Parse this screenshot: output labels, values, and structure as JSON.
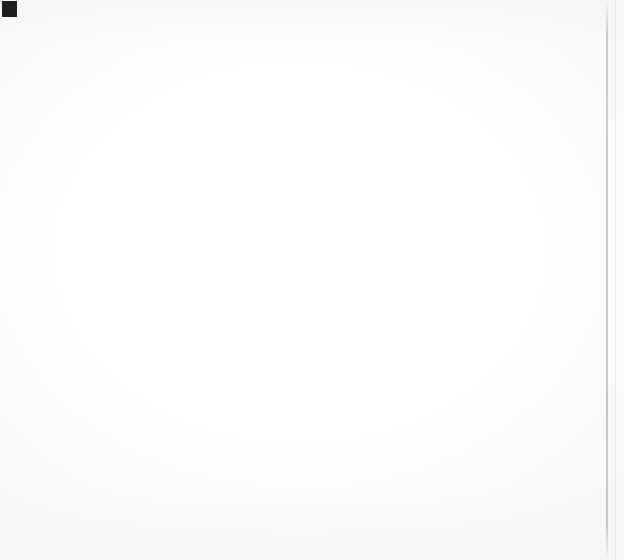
{
  "corner_mark": "black-square-register-mark",
  "chart_data": {
    "type": "bar",
    "orientation": "horizontal",
    "title": "Highest Marginal Tax Rate (2013)",
    "xlabel": "",
    "ylabel": "",
    "xlim": [
      0,
      70
    ],
    "grid": false,
    "legend": false,
    "categories": [
      "Denmark",
      "Japan",
      "Cuba",
      "Australia",
      "Germany",
      "China",
      "United States",
      "Canada",
      "Singapore",
      "Hong Kong",
      "Bolivia",
      "Russia",
      "Monaco"
    ],
    "values": [
      61,
      50,
      50,
      45,
      45,
      45,
      39.6,
      29,
      20,
      15,
      13,
      13,
      0
    ],
    "value_labels": [
      "61%",
      "50%",
      "50%",
      "45%",
      "45%",
      "45%",
      "39.6%",
      "29%",
      "20%",
      "15%",
      "13%",
      "13%",
      "0%"
    ],
    "bar_colors": [
      "#8e8e8e",
      "#333333",
      "#858585",
      "#2b2b2b",
      "#c0c0c0",
      "#ababab",
      "#bdbdbd",
      "#6e6e6e",
      "#737373",
      "#999999",
      "#242424",
      "#9c9c9c",
      "#ffffff"
    ],
    "highlighted_category": "United States"
  },
  "rows": [
    {
      "label": "Denmark",
      "value_label": "61%",
      "value": 61,
      "bar_px": 395,
      "color": "#8e8e8e",
      "bold": false
    },
    {
      "label": "Japan",
      "value_label": "50%",
      "value": 50,
      "bar_px": 324,
      "color": "#333333",
      "bold": false
    },
    {
      "label": "Cuba",
      "value_label": "50%",
      "value": 50,
      "bar_px": 324,
      "color": "#858585",
      "bold": false
    },
    {
      "label": "Australia",
      "value_label": "45%",
      "value": 45,
      "bar_px": 292,
      "color": "#2b2b2b",
      "bold": false
    },
    {
      "label": "Germany",
      "value_label": "45%",
      "value": 45,
      "bar_px": 292,
      "color": "#c0c0c0",
      "bold": false
    },
    {
      "label": "China",
      "value_label": "45%",
      "value": 45,
      "bar_px": 292,
      "color": "#ababab",
      "bold": false
    },
    {
      "label": "United States",
      "value_label": "39.6%",
      "value": 39.6,
      "bar_px": 255,
      "color": "#bdbdbd",
      "bold": true
    },
    {
      "label": "Canada",
      "value_label": "29%",
      "value": 29,
      "bar_px": 189,
      "color": "#6e6e6e",
      "bold": false
    },
    {
      "label": "Singapore",
      "value_label": "20%",
      "value": 20,
      "bar_px": 130,
      "color": "#737373",
      "bold": false
    },
    {
      "label": "Hong Kong",
      "value_label": "15%",
      "value": 15,
      "bar_px": 99,
      "color": "#999999",
      "bold": false
    },
    {
      "label": "Bolivia",
      "value_label": "13%",
      "value": 13,
      "bar_px": 85,
      "color": "#242424",
      "bold": false
    },
    {
      "label": "Russia",
      "value_label": "13%",
      "value": 13,
      "bar_px": 85,
      "color": "#9c9c9c",
      "bold": false
    },
    {
      "label": "Monaco",
      "value_label": "0%",
      "value": 0,
      "bar_px": 0,
      "color": "#ffffff",
      "bold": false
    }
  ]
}
